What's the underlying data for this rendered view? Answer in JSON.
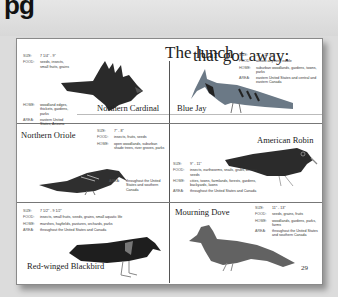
{
  "heading": {
    "partial_text": "pg"
  },
  "title": {
    "left": "The lunch",
    "right": "that got away:"
  },
  "page_number": "29",
  "birds": [
    {
      "name": "Northern Cardinal",
      "color": "#2a2a2a",
      "facts": {
        "size": "7 1/4\" - 9\"",
        "food": "seeds, insects, small fruits, grains",
        "home": "woodland edges, thickets, gardens, parks",
        "area": "eastern United States, Arizona"
      }
    },
    {
      "name": "Blue Jay",
      "color": "#5a6a78",
      "facts": {
        "size": "11\" - 12 1/2\"",
        "food": "almost anything edible",
        "home": "suburban woodlands, gardens, towns, parks",
        "area": "eastern United States and central and eastern Canada"
      }
    },
    {
      "name": "Northern Oriole",
      "color": "#333333",
      "facts": {
        "size": "7\" - 8\"",
        "food": "insects, fruits, seeds",
        "home": "open woodlands, suburban shade trees, river groves, parks",
        "area": "throughout the United States and southern Canada"
      }
    },
    {
      "name": "American Robin",
      "color": "#2b2b2b",
      "facts": {
        "size": "9\" - 11\"",
        "food": "insects, earthworms, snails, grubs, berries, seeds",
        "home": "cities, towns, farmlands, forests, gardens, backyards, lawns",
        "area": "throughout the United States and Canada"
      }
    },
    {
      "name": "Red-winged Blackbird",
      "color": "#1e1e1e",
      "facts": {
        "size": "7 1/2\" - 9 1/2\"",
        "food": "insects, small fruits, seeds, grains, small aquatic life",
        "home": "marshes, hayfields, pastures, orchards, parks",
        "area": "throughout the United States and Canada"
      }
    },
    {
      "name": "Mourning Dove",
      "color": "#5e5e5e",
      "facts": {
        "size": "11\" - 13\"",
        "food": "seeds, grains, fruits",
        "home": "woodlands, gardens, parks, farms",
        "area": "throughout the United States and southern Canada"
      }
    }
  ],
  "labels": {
    "size": "SIZE:",
    "food": "FOOD:",
    "home": "HOME:",
    "area": "AREA:"
  }
}
